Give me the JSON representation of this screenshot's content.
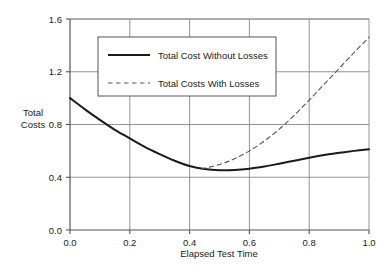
{
  "chart_data": {
    "type": "line",
    "title": "",
    "xlabel": "Elapsed Test Time",
    "ylabel": "Total\nCosts",
    "ylabel_line1": "Total",
    "ylabel_line2": "Costs",
    "xlim": [
      0.0,
      1.0
    ],
    "ylim": [
      0.0,
      1.6
    ],
    "xticks": [
      "0.0",
      "0.2",
      "0.4",
      "0.6",
      "0.8",
      "1.0"
    ],
    "xtick_values": [
      0.0,
      0.2,
      0.4,
      0.6,
      0.8,
      1.0
    ],
    "yticks": [
      "0.0",
      "0.4",
      "0.8",
      "1.2",
      "1.6"
    ],
    "ytick_values": [
      0.0,
      0.4,
      0.8,
      1.2,
      1.6
    ],
    "grid": true,
    "legend_position": "upper-center",
    "series": [
      {
        "name": "Total Cost Without Losses",
        "style": "solid",
        "color": "#1a1a1a",
        "width": 2.0,
        "x": [
          0.0,
          0.05,
          0.1,
          0.15,
          0.2,
          0.25,
          0.3,
          0.35,
          0.4,
          0.45,
          0.5,
          0.55,
          0.6,
          0.65,
          0.7,
          0.75,
          0.8,
          0.85,
          0.9,
          0.95,
          1.0
        ],
        "values": [
          1.0,
          0.915,
          0.835,
          0.76,
          0.695,
          0.63,
          0.575,
          0.525,
          0.485,
          0.462,
          0.453,
          0.455,
          0.465,
          0.482,
          0.503,
          0.525,
          0.548,
          0.568,
          0.585,
          0.6,
          0.613
        ]
      },
      {
        "name": "Total Costs With Losses",
        "style": "dashed",
        "color": "#555555",
        "width": 1.1,
        "x": [
          0.44,
          0.5,
          0.55,
          0.6,
          0.65,
          0.7,
          0.75,
          0.8,
          0.85,
          0.9,
          0.95,
          1.0
        ],
        "values": [
          0.463,
          0.497,
          0.54,
          0.6,
          0.675,
          0.765,
          0.87,
          0.985,
          1.105,
          1.225,
          1.345,
          1.462
        ]
      }
    ]
  },
  "legend": {
    "items": [
      {
        "label": "Total Cost Without Losses",
        "style": "solid"
      },
      {
        "label": "Total Costs With Losses",
        "style": "dashed"
      }
    ]
  },
  "axes": {
    "x_title": "Elapsed Test Time",
    "y_title_line1": "Total",
    "y_title_line2": "Costs"
  },
  "colors": {
    "background": "#ffffff",
    "axis": "#555555",
    "grid": "#888888",
    "text": "#1a1a1a",
    "series_solid": "#1a1a1a",
    "series_dashed": "#555555"
  }
}
